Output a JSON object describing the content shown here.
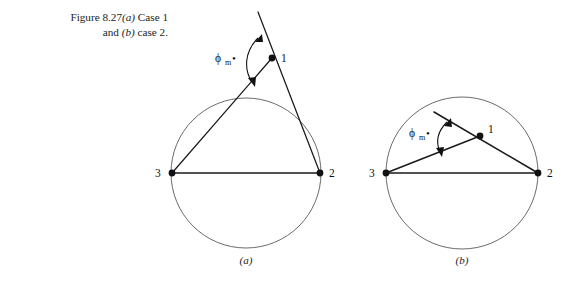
{
  "figure": {
    "caption": {
      "line1_prefix": "Figure 8.27",
      "line1_italic": "(a)",
      "line1_suffix": " Case 1",
      "line2_prefix": "and ",
      "line2_italic": "(b)",
      "line2_suffix": " case 2."
    },
    "panels": [
      {
        "id": "panel-a",
        "subcaption": "(a)",
        "angle_label": {
          "symbol": "ϕ",
          "subscript": "m",
          "marker": "•"
        },
        "nodes": [
          {
            "id": "node-1",
            "label": "1"
          },
          {
            "id": "node-2",
            "label": "2"
          },
          {
            "id": "node-3",
            "label": "3"
          }
        ]
      },
      {
        "id": "panel-b",
        "subcaption": "(b)",
        "angle_label": {
          "symbol": "ϕ",
          "subscript": "m",
          "marker": "•"
        },
        "nodes": [
          {
            "id": "node-1",
            "label": "1"
          },
          {
            "id": "node-2",
            "label": "2"
          },
          {
            "id": "node-3",
            "label": "3"
          }
        ]
      }
    ],
    "colors": {
      "ink": "#1a1a1a",
      "circle_stroke": "#595959",
      "background": "#ffffff"
    }
  }
}
